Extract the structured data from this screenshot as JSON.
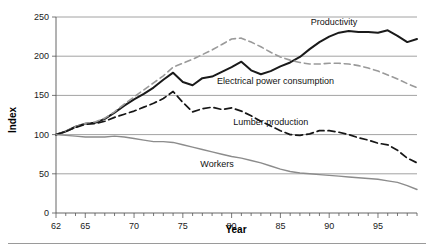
{
  "chart_data": {
    "type": "line",
    "title": "",
    "xlabel": "Year",
    "ylabel": "Index",
    "xlim": [
      62,
      99
    ],
    "ylim": [
      0,
      250
    ],
    "ytick_labels": [
      "0",
      "50",
      "100",
      "150",
      "200",
      "250"
    ],
    "yticks": [
      0,
      50,
      100,
      150,
      200,
      250
    ],
    "xtick_labels": [
      "62",
      "65",
      "70",
      "75",
      "80",
      "85",
      "90",
      "95"
    ],
    "xticks": [
      62,
      65,
      70,
      75,
      80,
      85,
      90,
      95
    ],
    "minor_xtick_step": 1,
    "grid": "horizontal",
    "legend": "inline-labels",
    "x": [
      62,
      63,
      64,
      65,
      66,
      67,
      68,
      69,
      70,
      71,
      72,
      73,
      74,
      75,
      76,
      77,
      78,
      79,
      80,
      81,
      82,
      83,
      84,
      85,
      86,
      87,
      88,
      89,
      90,
      91,
      92,
      93,
      94,
      95,
      96,
      97,
      98,
      99
    ],
    "series": [
      {
        "name": "Productivity",
        "style": "solid",
        "color": "#1a1a1a",
        "width": 2.0,
        "label_x": 90.5,
        "label_y": 243,
        "values": [
          100,
          104,
          110,
          114,
          115,
          120,
          128,
          137,
          145,
          152,
          160,
          170,
          179,
          167,
          163,
          172,
          174,
          180,
          186,
          193,
          182,
          177,
          181,
          187,
          192,
          199,
          209,
          218,
          225,
          230,
          232,
          231,
          231,
          230,
          233,
          226,
          218,
          222
        ]
      },
      {
        "name": "Electrical power consumption",
        "style": "dashed",
        "color": "#9a9a9a",
        "width": 1.6,
        "label_x": 84.5,
        "label_y": 168,
        "values": [
          100,
          104,
          110,
          114,
          116,
          121,
          129,
          139,
          148,
          157,
          166,
          175,
          186,
          191,
          196,
          202,
          208,
          215,
          222,
          223,
          218,
          212,
          205,
          199,
          195,
          192,
          190,
          190,
          191,
          191,
          190,
          188,
          185,
          181,
          176,
          171,
          165,
          160
        ]
      },
      {
        "name": "Lumber production",
        "style": "dashed",
        "color": "#161616",
        "width": 1.7,
        "label_x": 84.0,
        "label_y": 116,
        "values": [
          100,
          104,
          109,
          113,
          114,
          117,
          122,
          126,
          130,
          135,
          140,
          146,
          155,
          141,
          129,
          133,
          135,
          132,
          134,
          130,
          124,
          117,
          111,
          105,
          100,
          99,
          101,
          105,
          105,
          103,
          100,
          96,
          93,
          89,
          87,
          80,
          70,
          64
        ]
      },
      {
        "name": "Workers",
        "style": "solid",
        "color": "#8c8c8c",
        "width": 1.4,
        "label_x": 78.5,
        "label_y": 62,
        "values": [
          100,
          99,
          98,
          97,
          97,
          97,
          98,
          97,
          95,
          93,
          91,
          91,
          90,
          87,
          84,
          81,
          78,
          75,
          72,
          70,
          67,
          64,
          60,
          56,
          53,
          51,
          50,
          49,
          48,
          47,
          46,
          45,
          44,
          43,
          41,
          39,
          35,
          30
        ]
      }
    ]
  }
}
